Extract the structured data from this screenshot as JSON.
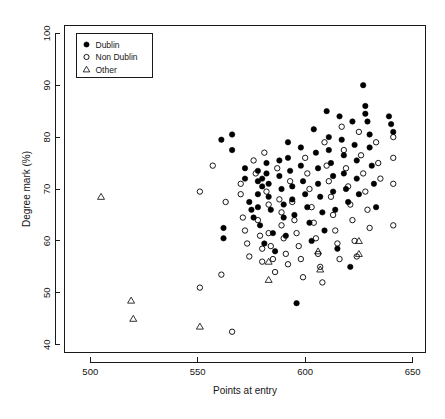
{
  "chart_data": {
    "type": "scatter",
    "title": "",
    "xlabel": "Points at entry",
    "ylabel": "Degree mark (%)",
    "xlim": [
      488,
      656
    ],
    "ylim": [
      38.5,
      101.5
    ],
    "xticks": [
      500,
      550,
      600,
      650
    ],
    "yticks": [
      40,
      50,
      60,
      70,
      80,
      90,
      100
    ],
    "grid": false,
    "legend": {
      "position": "top-left",
      "entries": [
        {
          "label": "Dublin",
          "marker": "filled-circle"
        },
        {
          "label": "Non Dublin",
          "marker": "open-circle"
        },
        {
          "label": "Other",
          "marker": "open-triangle"
        }
      ]
    },
    "series": [
      {
        "name": "Dublin",
        "marker": "filled-circle",
        "color": "#000000",
        "points": [
          [
            561,
            79.5
          ],
          [
            566,
            80.5
          ],
          [
            566,
            77.5
          ],
          [
            562,
            62.5
          ],
          [
            562,
            60.5
          ],
          [
            572,
            74.0
          ],
          [
            572,
            72.0
          ],
          [
            574,
            67.5
          ],
          [
            575,
            66.0
          ],
          [
            576,
            64.5
          ],
          [
            578,
            73.5
          ],
          [
            578,
            71.5
          ],
          [
            578,
            69.0
          ],
          [
            578,
            66.5
          ],
          [
            579,
            63.0
          ],
          [
            580,
            72.0
          ],
          [
            580,
            70.5
          ],
          [
            581,
            59.5
          ],
          [
            582,
            75.0
          ],
          [
            582,
            73.0
          ],
          [
            583,
            71.0
          ],
          [
            583,
            68.5
          ],
          [
            584,
            66.0
          ],
          [
            585,
            61.5
          ],
          [
            586,
            58.0
          ],
          [
            588,
            75.5
          ],
          [
            588,
            72.5
          ],
          [
            589,
            70.0
          ],
          [
            590,
            67.0
          ],
          [
            590,
            64.5
          ],
          [
            591,
            61.0
          ],
          [
            592,
            79.0
          ],
          [
            592,
            76.0
          ],
          [
            593,
            73.5
          ],
          [
            594,
            70.5
          ],
          [
            594,
            68.0
          ],
          [
            595,
            65.0
          ],
          [
            596,
            48.0
          ],
          [
            598,
            78.0
          ],
          [
            598,
            74.5
          ],
          [
            599,
            71.5
          ],
          [
            600,
            69.0
          ],
          [
            601,
            66.5
          ],
          [
            602,
            63.5
          ],
          [
            603,
            60.0
          ],
          [
            604,
            81.5
          ],
          [
            605,
            77.0
          ],
          [
            606,
            74.0
          ],
          [
            606,
            71.0
          ],
          [
            607,
            68.5
          ],
          [
            608,
            65.5
          ],
          [
            609,
            62.0
          ],
          [
            610,
            85.0
          ],
          [
            611,
            80.0
          ],
          [
            611,
            77.5
          ],
          [
            612,
            75.0
          ],
          [
            613,
            72.5
          ],
          [
            613,
            69.5
          ],
          [
            614,
            66.0
          ],
          [
            615,
            58.5
          ],
          [
            616,
            84.0
          ],
          [
            617,
            79.5
          ],
          [
            618,
            76.5
          ],
          [
            618,
            73.0
          ],
          [
            619,
            70.0
          ],
          [
            620,
            67.5
          ],
          [
            621,
            55.0
          ],
          [
            622,
            83.0
          ],
          [
            623,
            78.5
          ],
          [
            624,
            75.5
          ],
          [
            624,
            72.0
          ],
          [
            625,
            69.0
          ],
          [
            627,
            90.0
          ],
          [
            628,
            86.0
          ],
          [
            628,
            84.5
          ],
          [
            629,
            83.0
          ],
          [
            630,
            80.5
          ],
          [
            630,
            78.0
          ],
          [
            631,
            74.5
          ],
          [
            632,
            71.0
          ],
          [
            633,
            66.5
          ],
          [
            639,
            84.0
          ],
          [
            640,
            82.5
          ],
          [
            641,
            81.0
          ]
        ]
      },
      {
        "name": "Non Dublin",
        "marker": "open-circle",
        "color": "#000000",
        "points": [
          [
            551,
            69.5
          ],
          [
            551,
            51.0
          ],
          [
            557,
            74.5
          ],
          [
            561,
            53.5
          ],
          [
            563,
            67.5
          ],
          [
            566,
            42.5
          ],
          [
            570,
            71.0
          ],
          [
            570,
            69.0
          ],
          [
            571,
            64.5
          ],
          [
            572,
            62.0
          ],
          [
            573,
            59.5
          ],
          [
            574,
            57.0
          ],
          [
            576,
            75.5
          ],
          [
            577,
            73.0
          ],
          [
            578,
            64.0
          ],
          [
            579,
            61.0
          ],
          [
            580,
            58.5
          ],
          [
            580,
            56.0
          ],
          [
            581,
            77.0
          ],
          [
            582,
            69.5
          ],
          [
            583,
            67.0
          ],
          [
            583,
            61.5
          ],
          [
            584,
            59.0
          ],
          [
            585,
            56.5
          ],
          [
            586,
            54.0
          ],
          [
            587,
            74.0
          ],
          [
            588,
            68.0
          ],
          [
            589,
            65.5
          ],
          [
            589,
            63.0
          ],
          [
            590,
            60.5
          ],
          [
            591,
            57.5
          ],
          [
            592,
            55.5
          ],
          [
            593,
            71.5
          ],
          [
            594,
            67.5
          ],
          [
            595,
            64.0
          ],
          [
            596,
            61.5
          ],
          [
            597,
            59.0
          ],
          [
            598,
            56.5
          ],
          [
            599,
            53.0
          ],
          [
            600,
            76.0
          ],
          [
            601,
            73.0
          ],
          [
            602,
            70.0
          ],
          [
            603,
            66.5
          ],
          [
            604,
            63.5
          ],
          [
            605,
            60.5
          ],
          [
            606,
            57.5
          ],
          [
            607,
            55.0
          ],
          [
            608,
            52.0
          ],
          [
            609,
            79.0
          ],
          [
            610,
            74.5
          ],
          [
            611,
            71.5
          ],
          [
            612,
            68.5
          ],
          [
            613,
            65.0
          ],
          [
            614,
            62.0
          ],
          [
            615,
            59.5
          ],
          [
            616,
            56.5
          ],
          [
            617,
            82.0
          ],
          [
            618,
            77.5
          ],
          [
            619,
            74.0
          ],
          [
            620,
            70.5
          ],
          [
            621,
            67.0
          ],
          [
            622,
            64.0
          ],
          [
            623,
            60.0
          ],
          [
            624,
            57.0
          ],
          [
            625,
            81.0
          ],
          [
            626,
            76.5
          ],
          [
            627,
            73.0
          ],
          [
            628,
            69.5
          ],
          [
            629,
            66.0
          ],
          [
            630,
            62.5
          ],
          [
            633,
            79.0
          ],
          [
            634,
            75.0
          ],
          [
            635,
            72.0
          ],
          [
            641,
            80.0
          ],
          [
            641,
            76.0
          ],
          [
            641,
            71.0
          ],
          [
            641,
            63.0
          ]
        ]
      },
      {
        "name": "Other",
        "marker": "open-triangle",
        "color": "#000000",
        "points": [
          [
            505,
            68.5
          ],
          [
            519,
            48.5
          ],
          [
            520,
            45.0
          ],
          [
            551,
            43.5
          ],
          [
            583,
            56.0
          ],
          [
            583,
            52.5
          ],
          [
            606,
            58.0
          ],
          [
            607,
            54.5
          ],
          [
            625,
            60.0
          ],
          [
            625,
            57.5
          ]
        ]
      }
    ]
  }
}
